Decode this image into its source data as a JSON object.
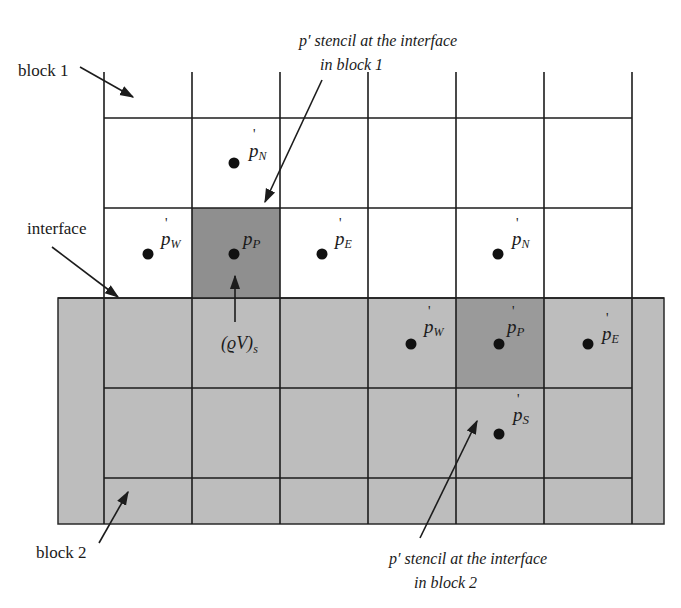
{
  "figure": {
    "type": "grid-stencil-diagram",
    "colors": {
      "line": "#1c1c1c",
      "block2_fill": "#bdbdbd",
      "stencil_fill_block1": "#8f8f8f",
      "stencil_fill_block2": "#9a9a9a",
      "point": "#111111",
      "background": "#ffffff"
    },
    "labels": {
      "block1": "block 1",
      "block2": "block 2",
      "interface": "interface",
      "stencil_block1_line1": "p′ stencil at the interface",
      "stencil_block1_line2": "in block 1",
      "stencil_block2_line1": "p′ stencil at the interface",
      "stencil_block2_line2": "in block 2",
      "mass_flux": "(ϱV)",
      "mass_flux_sub": "s"
    },
    "block1_points": [
      {
        "name": "p'N",
        "base": "p",
        "sub": "N"
      },
      {
        "name": "p'W",
        "base": "p",
        "sub": "W"
      },
      {
        "name": "p'P",
        "base": "p",
        "sub": "P"
      },
      {
        "name": "p'E",
        "base": "p",
        "sub": "E"
      },
      {
        "name": "p'N (second)",
        "base": "p",
        "sub": "N"
      }
    ],
    "block2_points": [
      {
        "name": "p'W",
        "base": "p",
        "sub": "W"
      },
      {
        "name": "p'P",
        "base": "p",
        "sub": "P"
      },
      {
        "name": "p'E",
        "base": "p",
        "sub": "E"
      },
      {
        "name": "p'S",
        "base": "p",
        "sub": "S"
      }
    ]
  }
}
